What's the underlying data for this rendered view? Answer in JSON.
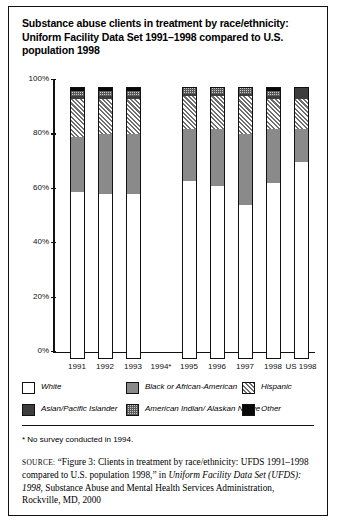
{
  "figure": {
    "title": "Substance abuse clients in treatment by race/ethnicity: Uniform Facility Data Set 1991–1998 compared to U.S. population 1998",
    "footnote": "* No survey conducted in 1994.",
    "source_label": "SOURCE:",
    "source_part1": " “Figure 3: Clients in treatment by race/ethnicity: UFDS 1991–1998 compared to U.S. population 1998,” in ",
    "source_italic1": "Uniform Facility Data Set (UFDS): 1998",
    "source_part2": ", Substance Abuse and Mental Health Services Administration, Rockville, MD, 2000"
  },
  "legend": {
    "entries": [
      {
        "label": "White",
        "pattern": "solid-white",
        "color": "#ffffff"
      },
      {
        "label": "Black or African-American",
        "pattern": "solid-gray",
        "color": "#8a8a8a"
      },
      {
        "label": "Hispanic",
        "pattern": "diagonal-hatch",
        "color": "#d9d9d9"
      },
      {
        "label": "Asian/Pacific Islander",
        "pattern": "solid-dark-gray",
        "color": "#3d3d3d"
      },
      {
        "label": "American Indian/ Alaskan Native",
        "pattern": "checkered",
        "color": "#c9c9c9"
      },
      {
        "label": "Other",
        "pattern": "solid-black",
        "color": "#0a0a0a"
      }
    ]
  },
  "chart_data": {
    "type": "bar",
    "stacked": true,
    "title": "Substance abuse clients in treatment by race/ethnicity: Uniform Facility Data Set 1991–1998 compared to U.S. population 1998",
    "xlabel": "",
    "ylabel": "",
    "ylim": [
      0,
      100
    ],
    "ytick_labels": [
      "0%",
      "20%",
      "40%",
      "60%",
      "80%",
      "100%"
    ],
    "ytick_values": [
      0,
      20,
      40,
      60,
      80,
      100
    ],
    "grid": false,
    "legend_position": "below-plot",
    "categories": [
      "1991",
      "1992",
      "1993",
      "1994*",
      "1995",
      "1996",
      "1997",
      "1998",
      "US 1998"
    ],
    "series": [
      {
        "name": "White",
        "values": [
          61,
          60,
          60,
          null,
          65,
          63,
          56,
          64,
          72
        ]
      },
      {
        "name": "Black or African-American",
        "values": [
          20,
          22,
          22,
          null,
          19,
          21,
          26,
          20,
          12
        ]
      },
      {
        "name": "Hispanic",
        "values": [
          14,
          13,
          13,
          null,
          12,
          12,
          14,
          11,
          11
        ]
      },
      {
        "name": "Asian/Pacific Islander",
        "values": [
          1,
          1,
          1,
          null,
          1,
          1,
          1,
          1,
          4
        ]
      },
      {
        "name": "American Indian/Alaskan Native",
        "values": [
          2,
          2,
          2,
          null,
          2,
          2,
          2,
          2,
          1
        ]
      },
      {
        "name": "Other",
        "values": [
          2,
          2,
          2,
          null,
          1,
          1,
          1,
          2,
          0
        ]
      }
    ],
    "notes": [
      "* No survey conducted in 1994.",
      "1994 has no data — no bar is drawn."
    ]
  }
}
